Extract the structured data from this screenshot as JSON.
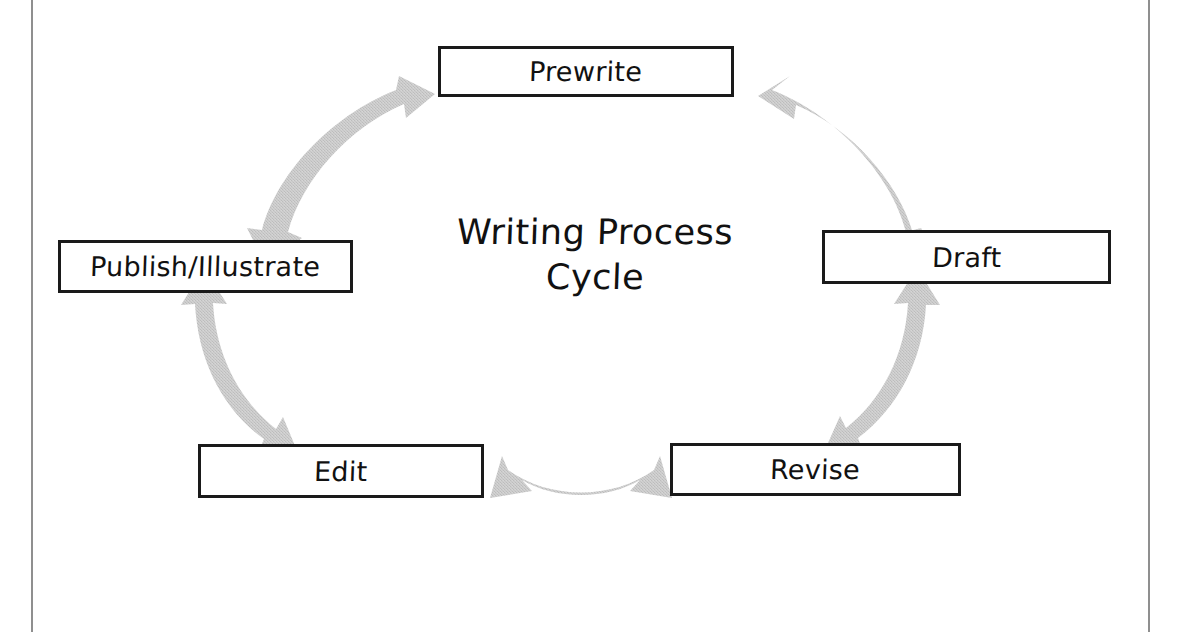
{
  "document": {
    "title": "Writing Process Cycle"
  },
  "diagram": {
    "type": "cycle",
    "center_title_line1": "Writing Process",
    "center_title_line2": "Cycle",
    "arrow_color": "#c9c9c9",
    "box_border_color": "#1a1a1a",
    "box_fill_color": "#ffffff",
    "text_color": "#111111",
    "nodes": [
      {
        "id": "prewrite",
        "label": "Prewrite"
      },
      {
        "id": "draft",
        "label": "Draft"
      },
      {
        "id": "revise",
        "label": "Revise"
      },
      {
        "id": "edit",
        "label": "Edit"
      },
      {
        "id": "publish",
        "label": "Publish/Illustrate"
      }
    ],
    "connectors": [
      {
        "id": "prewrite-draft",
        "from": "Prewrite",
        "to": "Draft",
        "style": "double-headed-curved-arrow"
      },
      {
        "id": "draft-revise",
        "from": "Draft",
        "to": "Revise",
        "style": "double-headed-curved-arrow"
      },
      {
        "id": "revise-edit",
        "from": "Revise",
        "to": "Edit",
        "style": "double-headed-curved-arrow"
      },
      {
        "id": "edit-publish",
        "from": "Edit",
        "to": "Publish/Illustrate",
        "style": "double-headed-curved-arrow"
      },
      {
        "id": "publish-prewrite",
        "from": "Publish/Illustrate",
        "to": "Prewrite",
        "style": "double-headed-curved-arrow"
      }
    ]
  }
}
